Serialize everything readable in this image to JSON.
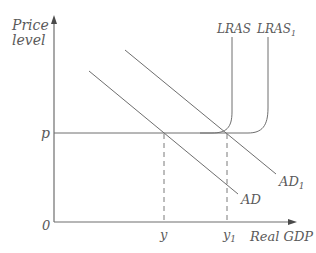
{
  "axes": {
    "y_label_line1": "Price",
    "y_label_line2": "level",
    "x_label": "Real GDP",
    "origin_label": "0"
  },
  "ticks": {
    "price": "p",
    "output": "y",
    "output1_base": "y",
    "output1_sub": "1"
  },
  "curves": {
    "lras": "LRAS",
    "lras1_base": "LRAS",
    "lras1_sub": "1",
    "ad": "AD",
    "ad1_base": "AD",
    "ad1_sub": "1"
  },
  "colors": {
    "line": "#6e6e6e",
    "text": "#5a5a5a",
    "background": "#ffffff"
  }
}
